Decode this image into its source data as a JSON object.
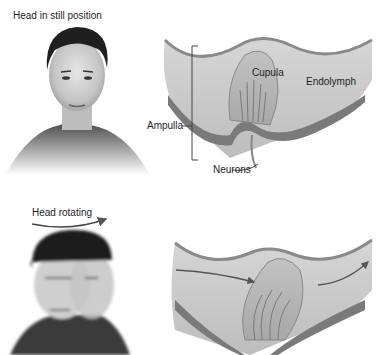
{
  "panels": [
    {
      "caption": "Head in still position",
      "state": "still",
      "labels": {
        "cupula": "Cupula",
        "endolymph": "Endolymph",
        "ampulla": "Ampulla",
        "neurons": "Neurons"
      }
    },
    {
      "caption": "Head rotating",
      "state": "rotating"
    }
  ],
  "colors": {
    "background": "#ffffff",
    "fluid": "#c8c8c8",
    "membrane": "#8a8a8a",
    "cupula": "#b4b4b4",
    "epithelium": "#6e6e6e",
    "hair": "#1f1f1f",
    "skin": "#d8d8d8",
    "text": "#1e1e1e"
  }
}
